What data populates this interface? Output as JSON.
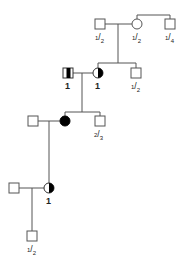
{
  "diagram": {
    "type": "pedigree",
    "line_color": "#555555",
    "affected_color": "#000000",
    "generations": [
      {
        "id": "gen1",
        "individuals": [
          {
            "id": "g1_father",
            "sex": "male",
            "status": "unaffected",
            "label": "1/2"
          },
          {
            "id": "g1_mother",
            "sex": "female",
            "status": "unaffected",
            "label": "1/2"
          },
          {
            "id": "g1_mother_brother",
            "sex": "male",
            "status": "unaffected",
            "label": "1/4"
          }
        ]
      },
      {
        "id": "gen2",
        "individuals": [
          {
            "id": "g2_husband",
            "sex": "male",
            "status": "carrier-band",
            "label": "1"
          },
          {
            "id": "g2_wife",
            "sex": "female",
            "status": "half-affected",
            "label": "1"
          },
          {
            "id": "g2_wife_brother",
            "sex": "male",
            "status": "unaffected",
            "label": "1/2"
          }
        ]
      },
      {
        "id": "gen3",
        "individuals": [
          {
            "id": "g3_husband",
            "sex": "male",
            "status": "unaffected",
            "label": ""
          },
          {
            "id": "g3_wife",
            "sex": "female",
            "status": "affected",
            "label": ""
          },
          {
            "id": "g3_wife_brother",
            "sex": "male",
            "status": "unaffected",
            "label": "2/3"
          }
        ]
      },
      {
        "id": "gen4",
        "individuals": [
          {
            "id": "g4_husband",
            "sex": "male",
            "status": "unaffected",
            "label": ""
          },
          {
            "id": "g4_wife",
            "sex": "female",
            "status": "half-affected",
            "label": "1"
          }
        ]
      },
      {
        "id": "gen5",
        "individuals": [
          {
            "id": "g5_son",
            "sex": "male",
            "status": "unaffected",
            "label": "1/2"
          }
        ]
      }
    ],
    "labels": {
      "g1_father": {
        "num": "1",
        "den": "2"
      },
      "g1_mother": {
        "num": "1",
        "den": "2"
      },
      "g1_mother_brother": {
        "num": "1",
        "den": "4"
      },
      "g2_husband": "1",
      "g2_wife": "1",
      "g2_wife_brother": {
        "num": "1",
        "den": "2"
      },
      "g3_wife_brother": {
        "num": "2",
        "den": "3"
      },
      "g4_wife": "1",
      "g5_son": {
        "num": "1",
        "den": "2"
      }
    }
  }
}
